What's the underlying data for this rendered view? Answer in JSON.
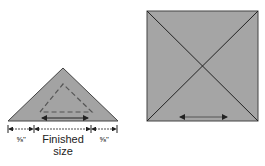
{
  "triangle": {
    "fill": "#a3a3a3",
    "seam_allowance_left": "⅝\"",
    "seam_allowance_right": "⅝\"",
    "finished_label_line1": "Finished",
    "finished_label_line2": "size"
  },
  "square": {
    "fill": "#a5a5a5"
  }
}
